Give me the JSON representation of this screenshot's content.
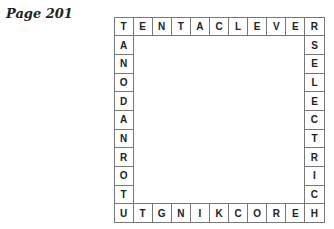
{
  "page_label": "Page 201",
  "puzzle": {
    "top": [
      "T",
      "E",
      "N",
      "T",
      "A",
      "C",
      "L",
      "E",
      "V",
      "E",
      "R"
    ],
    "left": [
      "T",
      "A",
      "N",
      "O",
      "D",
      "A",
      "N",
      "R",
      "O",
      "T",
      "U"
    ],
    "right": [
      "R",
      "S",
      "E",
      "L",
      "E",
      "C",
      "T",
      "R",
      "I",
      "C",
      "H"
    ],
    "bottom": [
      "U",
      "T",
      "G",
      "N",
      "I",
      "K",
      "C",
      "O",
      "R",
      "E",
      "H"
    ]
  }
}
